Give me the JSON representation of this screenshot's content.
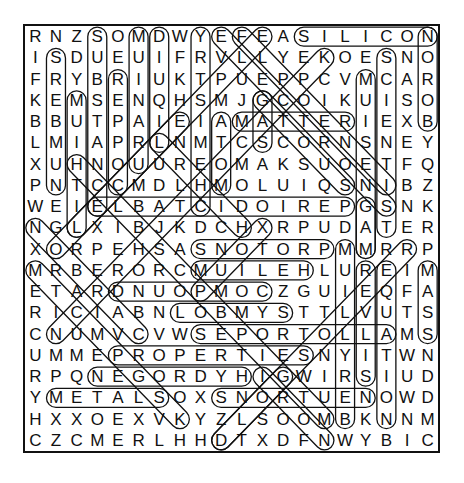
{
  "puzzle": {
    "rows": 20,
    "cols": 20,
    "grid": [
      "RNZSOMDWYEFEASILICON",
      "ISDUEUIFRVLLYEKOESNO",
      "FRYBRIUKTPUEPPCVMCAR",
      "KEMSENQHSMJGCOIKUISO",
      "BBUTPAIEIAMATTERIEXB",
      "LMIAPRLNMTCSCORNSNEY",
      "XUHNOUUREOMAKSUOETFQ",
      "PNTCCMDLHMOLUIQSNIBZ",
      "WEIELBATCIDOIREPGSNK",
      "NGLXIBJKDCHXRPUDATER",
      "XORPEHSASNOTORPMMRRP",
      "MRBERORCMUILEHLUREIM",
      "ETARDNUOPMOCZGUIEQFA",
      "RICIABNLOBMYSTTLVUTS",
      "CNUMVCVWSEPORTOLLAMS",
      "UMMEPROPERTIESNYITWN",
      "RPQNEGORDYHIGWIRSIUD",
      "YMETALSOXSNORTUENOWD",
      "HXXOEXVKYZLSOOMBKNNM",
      "CZCMERLHHDTXDFNWYBIC"
    ],
    "found_words": [
      {
        "word": "SILICON",
        "start": [
          0,
          13
        ],
        "end": [
          0,
          19
        ]
      },
      {
        "word": "BORON",
        "start": [
          4,
          19
        ],
        "end": [
          0,
          19
        ]
      },
      {
        "word": "MATTER",
        "start": [
          4,
          10
        ],
        "end": [
          4,
          15
        ]
      },
      {
        "word": "PERIODICTABLE",
        "start": [
          8,
          15
        ],
        "end": [
          8,
          3
        ]
      },
      {
        "word": "PROTONS",
        "start": [
          10,
          14
        ],
        "end": [
          10,
          8
        ]
      },
      {
        "word": "HELIUM",
        "start": [
          11,
          13
        ],
        "end": [
          11,
          8
        ]
      },
      {
        "word": "COMPOUND",
        "start": [
          12,
          11
        ],
        "end": [
          12,
          4
        ]
      },
      {
        "word": "SYMBOL",
        "start": [
          13,
          12
        ],
        "end": [
          13,
          7
        ]
      },
      {
        "word": "ALLOTROPES",
        "start": [
          14,
          17
        ],
        "end": [
          14,
          8
        ]
      },
      {
        "word": "PROPERTIES",
        "start": [
          15,
          4
        ],
        "end": [
          15,
          13
        ]
      },
      {
        "word": "HYDROGEN",
        "start": [
          16,
          10
        ],
        "end": [
          16,
          3
        ]
      },
      {
        "word": "METALS",
        "start": [
          17,
          1
        ],
        "end": [
          17,
          6
        ]
      },
      {
        "word": "NEUTRONS",
        "start": [
          17,
          16
        ],
        "end": [
          17,
          9
        ]
      },
      {
        "word": "NUMBERS",
        "start": [
          7,
          1
        ],
        "end": [
          1,
          1
        ]
      },
      {
        "word": "LITHIUM",
        "start": [
          9,
          2
        ],
        "end": [
          3,
          2
        ]
      },
      {
        "word": "SUBSTANCE",
        "start": [
          0,
          3
        ],
        "end": [
          8,
          3
        ]
      },
      {
        "word": "COPPER",
        "start": [
          7,
          4
        ],
        "end": [
          2,
          4
        ]
      },
      {
        "word": "URANIUM",
        "start": [
          6,
          5
        ],
        "end": [
          0,
          5
        ]
      },
      {
        "word": "LIQUID",
        "start": [
          5,
          6
        ],
        "end": [
          0,
          6
        ]
      },
      {
        "word": "CHEMISTRY",
        "start": [
          8,
          8
        ],
        "end": [
          0,
          8
        ]
      },
      {
        "word": "ATOM",
        "start": [
          4,
          9
        ],
        "end": [
          7,
          9
        ]
      },
      {
        "word": "GAS",
        "start": [
          3,
          11
        ],
        "end": [
          5,
          11
        ]
      },
      {
        "word": "SOLID",
        "start": [
          7,
          15
        ],
        "end": [
          3,
          11
        ]
      },
      {
        "word": "MAGNESIUM",
        "start": [
          10,
          16
        ],
        "end": [
          2,
          16
        ]
      },
      {
        "word": "SCIENTIST",
        "start": [
          1,
          17
        ],
        "end": [
          9,
          17
        ]
      },
      {
        "word": "EQUATION",
        "start": [
          11,
          17
        ],
        "end": [
          18,
          17
        ]
      },
      {
        "word": "SILVER",
        "start": [
          16,
          16
        ],
        "end": [
          11,
          16
        ]
      },
      {
        "word": "BERYLLIUM",
        "start": [
          18,
          15
        ],
        "end": [
          10,
          15
        ]
      },
      {
        "word": "MASS",
        "start": [
          11,
          19
        ],
        "end": [
          14,
          19
        ]
      },
      {
        "word": "GAT",
        "start": [
          8,
          16
        ],
        "end": [
          10,
          16
        ]
      },
      {
        "word": "PAIR",
        "start": [
          12,
          8
        ],
        "end": [
          9,
          11
        ]
      },
      {
        "word": "DIAG1",
        "start": [
          19,
          9
        ],
        "end": [
          10,
          18
        ]
      },
      {
        "word": "DIAG2",
        "start": [
          18,
          14
        ],
        "end": [
          6,
          2
        ]
      },
      {
        "word": "DIAG3",
        "start": [
          0,
          9
        ],
        "end": [
          8,
          17
        ]
      },
      {
        "word": "DIAG4",
        "start": [
          0,
          10
        ],
        "end": [
          7,
          17
        ]
      },
      {
        "word": "DIAG5",
        "start": [
          9,
          0
        ],
        "end": [
          14,
          5
        ]
      },
      {
        "word": "DIAG6",
        "start": [
          11,
          0
        ],
        "end": [
          18,
          7
        ]
      },
      {
        "word": "DIAG7",
        "start": [
          14,
          1
        ],
        "end": [
          1,
          14
        ]
      },
      {
        "word": "DIAG8",
        "start": [
          10,
          1
        ],
        "end": [
          0,
          11
        ]
      },
      {
        "word": "DIAG9",
        "start": [
          16,
          11
        ],
        "end": [
          19,
          14
        ]
      },
      {
        "word": "DIAG10",
        "start": [
          19,
          9
        ],
        "end": [
          16,
          12
        ]
      },
      {
        "word": "DIAG11",
        "start": [
          4,
          7
        ],
        "end": [
          9,
          2
        ]
      },
      {
        "word": "DIAG12",
        "start": [
          9,
          10
        ],
        "end": [
          5,
          6
        ]
      }
    ]
  }
}
